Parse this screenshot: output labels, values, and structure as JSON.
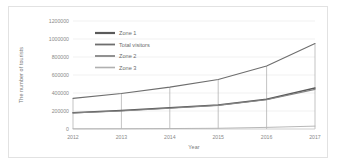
{
  "chart_data": {
    "type": "line",
    "title": "",
    "xlabel": "Year",
    "ylabel": "The number of tourists",
    "categories": [
      "2012",
      "2013",
      "2014",
      "2015",
      "2016",
      "2017"
    ],
    "x": [
      2012,
      2013,
      2014,
      2015,
      2016,
      2017
    ],
    "ylim": [
      0,
      1200000
    ],
    "xlim": [
      2012,
      2017
    ],
    "yticks": [
      0,
      200000,
      400000,
      600000,
      800000,
      1000000,
      1200000
    ],
    "ytick_labels": [
      "0",
      "200000",
      "400000",
      "600000",
      "800000",
      "1000000",
      "1200000"
    ],
    "grid": "horizontal",
    "legend_position": "upper-left-inside",
    "series": [
      {
        "name": "Zone 1",
        "color": "#5a5a5a",
        "width": 1.5,
        "values": [
          180000,
          205000,
          235000,
          268000,
          330000,
          455000
        ]
      },
      {
        "name": "Total visitors",
        "color": "#6e6e6e",
        "width": 1.1,
        "values": [
          340000,
          395000,
          465000,
          550000,
          700000,
          950000
        ]
      },
      {
        "name": "Zone 2",
        "color": "#858585",
        "width": 1.1,
        "values": [
          178000,
          200000,
          230000,
          263000,
          325000,
          440000
        ]
      },
      {
        "name": "Zone 3",
        "color": "#b0b0b0",
        "width": 0.9,
        "values": [
          2000,
          3000,
          5000,
          8000,
          18000,
          32000
        ]
      }
    ]
  },
  "legend": {
    "items": [
      {
        "label": "Zone 1"
      },
      {
        "label": "Total visitors"
      },
      {
        "label": "Zone 2"
      },
      {
        "label": "Zone 3"
      }
    ]
  },
  "axes": {
    "y_title": "The number of tourists",
    "x_title": "Year"
  }
}
